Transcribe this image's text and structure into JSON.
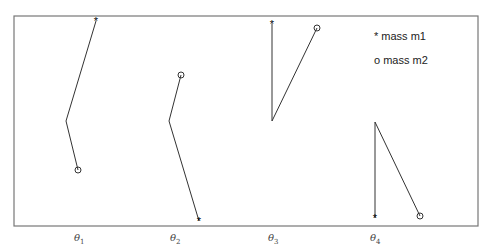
{
  "diagram": {
    "frame": {
      "x1": 14,
      "y1": 16,
      "x2": 478,
      "y2": 226,
      "color": "#777777"
    },
    "legend": {
      "m1": "* mass m1",
      "m2": "o mass m2"
    },
    "configurations": [
      {
        "label": "θ",
        "sub": "1",
        "label_x": 74,
        "mass_m1": {
          "x": 96,
          "y": 21
        },
        "pivot": {
          "x": 66,
          "y": 121
        },
        "mass_m2": {
          "x": 78,
          "y": 170
        }
      },
      {
        "label": "θ",
        "sub": "2",
        "label_x": 170,
        "mass_m2": {
          "x": 181,
          "y": 75
        },
        "pivot": {
          "x": 169,
          "y": 121
        },
        "mass_m1": {
          "x": 199,
          "y": 221
        }
      },
      {
        "label": "θ",
        "sub": "3",
        "label_x": 268,
        "mass_m1": {
          "x": 272,
          "y": 24
        },
        "pivot": {
          "x": 272,
          "y": 121
        },
        "mass_m2": {
          "x": 317,
          "y": 28
        }
      },
      {
        "label": "θ",
        "sub": "4",
        "label_x": 370,
        "pivot": {
          "x": 375,
          "y": 122
        },
        "mass_m1": {
          "x": 375,
          "y": 218
        },
        "mass_m2": {
          "x": 420,
          "y": 216
        }
      }
    ],
    "line_color": "#333333"
  }
}
